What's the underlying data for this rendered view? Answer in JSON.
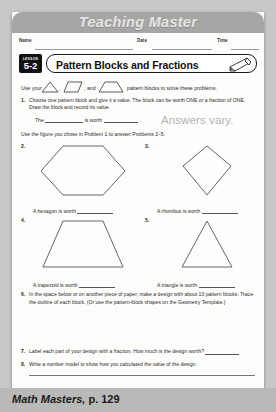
{
  "banner": {
    "title": "Teaching Master"
  },
  "fields": {
    "name_label": "Name",
    "date_label": "Date",
    "time_label": "Time"
  },
  "lesson": {
    "badge_word": "LESSON",
    "badge_number": "5-2",
    "title": "Pattern Blocks and Fractions",
    "pencil_icon": "pencil-icon"
  },
  "intro": {
    "part1": "Use your",
    "part2": ",",
    "part3": ", and",
    "part4": "pattern blocks to solve these problems.",
    "shape1": "triangle",
    "shape2": "rhombus",
    "shape3": "trapezoid"
  },
  "problems": [
    {
      "number": "1.",
      "text": "Choose one pattern block and give it a value. The block can be worth ONE or a fraction of ONE. Draw the block and record its value."
    },
    {
      "number": "6.",
      "text": "In the space below or on another piece of paper, make a design with about 10 pattern blocks. Trace the outline of each block. (Or use the pattern-block shapes on the Geometry Template.)"
    },
    {
      "number": "7.",
      "text": "Label each part of your design with a fraction. How much is the design worth?"
    },
    {
      "number": "8.",
      "text": "Write a number model to show how you calculated the value of the design."
    }
  ],
  "answer_prompt": {
    "the_label": "The",
    "is_worth_label": "is worth",
    "period": "."
  },
  "annotation": {
    "answers_vary": "Answers vary."
  },
  "instruction": "Use the figure you chose in Problem 1 to answer Problems 2–5.",
  "shape_problems": [
    {
      "number": "2.",
      "shape": "hexagon",
      "caption_prefix": "A hexagon is worth"
    },
    {
      "number": "3.",
      "shape": "rhombus",
      "caption_prefix": "A rhombus is worth"
    },
    {
      "number": "4.",
      "shape": "trapezoid",
      "caption_prefix": "A trapezoid is worth"
    },
    {
      "number": "5.",
      "shape": "triangle",
      "caption_prefix": "A triangle is worth"
    }
  ],
  "footer": {
    "title_italic": "Math Masters,",
    "page": "p. 129"
  },
  "colors": {
    "banner": "#a6a6a4",
    "footer": "#b9b9b7",
    "page": "#fdfdfc",
    "annotation": "#b4b4b2"
  }
}
